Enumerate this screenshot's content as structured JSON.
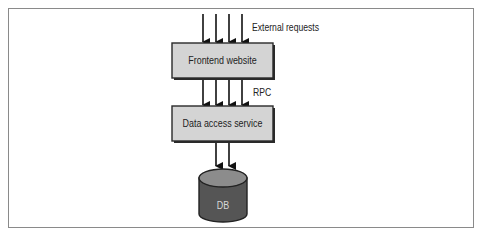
{
  "diagram": {
    "type": "architecture-flow",
    "nodes": [
      {
        "id": "frontend",
        "label": "Frontend website",
        "shape": "box"
      },
      {
        "id": "data_access",
        "label": "Data access service",
        "shape": "box"
      },
      {
        "id": "db",
        "label": "DB",
        "shape": "cylinder"
      }
    ],
    "edges": [
      {
        "from": "external",
        "to": "frontend",
        "count": 4,
        "label": "External requests"
      },
      {
        "from": "frontend",
        "to": "data_access",
        "count": 4,
        "label": "RPC"
      },
      {
        "from": "data_access",
        "to": "db",
        "count": 2,
        "label": ""
      }
    ],
    "colors": {
      "box_fill": "#d4d4d4",
      "box_border": "#2a2a2a",
      "db_body": "#555555",
      "db_top": "#8c8c8c",
      "frame": "#8a8a8a"
    }
  },
  "labels": {
    "external_requests": "External requests",
    "rpc": "RPC",
    "frontend": "Frontend website",
    "data_access": "Data access service",
    "db": "DB"
  }
}
